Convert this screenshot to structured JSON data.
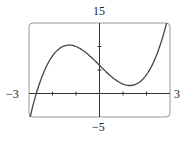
{
  "chart_data": {
    "type": "line",
    "title": "",
    "xlabel": "",
    "ylabel": "",
    "xlim": [
      -3,
      3
    ],
    "ylim": [
      -5,
      15
    ],
    "tick_labels": {
      "xmin": "−3",
      "xmax": "3",
      "ymin": "−5",
      "ymax": "15"
    },
    "x_ticks": [
      -2,
      -1,
      1,
      2
    ],
    "y_ticks": [
      5,
      10
    ],
    "grid": false,
    "series": [
      {
        "name": "f(x)",
        "x": [
          -3,
          -2.75,
          -2.5,
          -2.25,
          -2,
          -1.75,
          -1.5,
          -1.25,
          -1,
          -0.75,
          -0.5,
          -0.25,
          0,
          0.25,
          0.5,
          0.75,
          1,
          1.25,
          1.5,
          1.75,
          2,
          2.25,
          2.5,
          2.75,
          3
        ],
        "values": [
          -6,
          -1.05,
          2.88,
          5.86,
          8,
          9.39,
          10.13,
          10.3,
          10,
          9.33,
          8.38,
          7.23,
          6,
          4.77,
          3.63,
          2.67,
          2,
          1.7,
          1.88,
          2.61,
          4,
          6.14,
          9.13,
          13.05,
          18
        ]
      }
    ]
  }
}
